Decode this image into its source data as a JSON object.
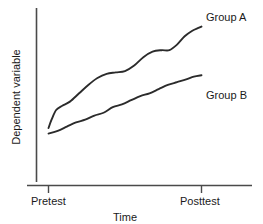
{
  "chart_data": {
    "type": "line",
    "title": "",
    "xlabel": "Time",
    "ylabel": "Dependent variable",
    "grid": false,
    "legend_position": "inline-right-of-line-end",
    "x_tick_labels": [
      "Pretest",
      "Posttest"
    ],
    "y_tick_labels": [],
    "xlim": [
      0,
      100
    ],
    "ylim": [
      0,
      100
    ],
    "series": [
      {
        "name": "Group A",
        "label": "Group A",
        "color": "#2b2b2b",
        "x": [
          0,
          2,
          5,
          9,
          14,
          20,
          26,
          32,
          38,
          44,
          50,
          56,
          62,
          68,
          74,
          79,
          84,
          89,
          94,
          98,
          100
        ],
        "values": [
          23,
          29,
          36,
          39,
          42,
          48,
          54,
          59,
          62,
          63,
          64,
          68,
          74,
          78,
          79,
          79,
          83,
          89,
          93,
          95,
          96
        ]
      },
      {
        "name": "Group B",
        "label": "Group B",
        "color": "#2b2b2b",
        "x": [
          0,
          6,
          12,
          18,
          24,
          30,
          36,
          42,
          48,
          54,
          60,
          66,
          72,
          78,
          84,
          90,
          95,
          100
        ],
        "values": [
          19,
          21,
          24,
          27,
          29,
          32,
          34,
          38,
          40,
          43,
          46,
          48,
          51,
          54,
          56,
          58,
          60,
          61
        ]
      }
    ]
  },
  "axes": {
    "x_title": "Time",
    "y_title": "Dependent variable",
    "tick_pretest": "Pretest",
    "tick_posttest": "Posttest"
  },
  "labels": {
    "group_a": "Group A",
    "group_b": "Group B"
  },
  "colors": {
    "line": "#2b2b2b",
    "axis": "#4a4a4a",
    "text": "#1a1a1a",
    "background": "#ffffff"
  }
}
